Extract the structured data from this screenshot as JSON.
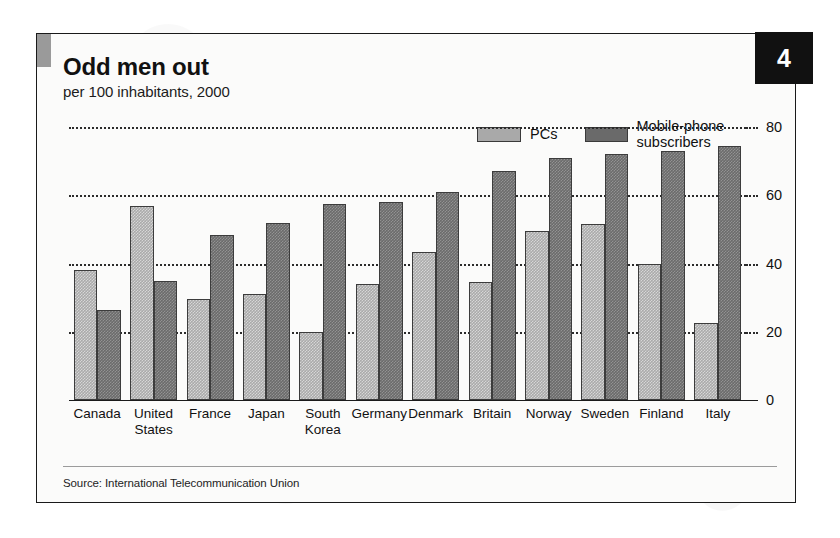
{
  "badge": {
    "number": "4"
  },
  "header": {
    "title": "Odd men out",
    "subtitle": "per 100 inhabitants, 2000"
  },
  "footer": {
    "source": "Source: International Telecommunication Union"
  },
  "legend": {
    "position": "top-right",
    "items": [
      {
        "label": "PCs",
        "color": "#a9a9a9"
      },
      {
        "label": "Mobile-phone subscribers",
        "color": "#6a6a6a"
      }
    ]
  },
  "chart_data": {
    "type": "bar",
    "title": "Odd men out",
    "subtitle": "per 100 inhabitants, 2000",
    "xlabel": "",
    "ylabel": "",
    "ylim": [
      0,
      80
    ],
    "yticks": [
      0,
      20,
      40,
      60,
      80
    ],
    "ytick_labels": [
      "0",
      "20",
      "40",
      "60",
      "80"
    ],
    "y_axis_position": "right",
    "grid": true,
    "grid_style": "dotted-horizontal",
    "categories": [
      "Canada",
      "United\nStates",
      "France",
      "Japan",
      "South\nKorea",
      "Germany",
      "Denmark",
      "Britain",
      "Norway",
      "Sweden",
      "Finland",
      "Italy"
    ],
    "series": [
      {
        "name": "PCs",
        "color": "#a9a9a9",
        "values": [
          38,
          57,
          29.5,
          31,
          20,
          34,
          43.5,
          34.5,
          49.5,
          51.5,
          40,
          22.5
        ]
      },
      {
        "name": "Mobile-phone subscribers",
        "color": "#6a6a6a",
        "values": [
          26.5,
          35,
          48.5,
          52,
          57.5,
          58,
          61,
          67,
          71,
          72,
          73,
          74.5
        ]
      }
    ],
    "source": "Source: International Telecommunication Union"
  }
}
